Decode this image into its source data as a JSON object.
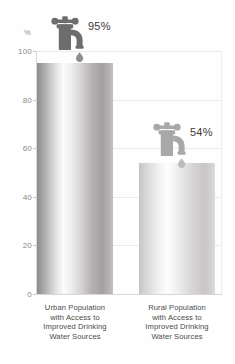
{
  "chart_data": {
    "type": "bar",
    "title": "",
    "xlabel": "",
    "ylabel": "%",
    "ylim": [
      0,
      100
    ],
    "grid": true,
    "legend": "none",
    "categories": [
      "Urban Population with Access to Improved Drinking Water Sources",
      "Rural Population with Access to Improved Drinking Water Sources"
    ],
    "values": [
      95,
      54
    ],
    "value_labels": [
      "95%",
      "54%"
    ],
    "yticks": [
      0,
      20,
      40,
      60,
      80,
      100
    ],
    "ytick_labels": [
      "0",
      "20",
      "40",
      "60",
      "80",
      "100"
    ],
    "unit_label": "%"
  },
  "axis": {
    "unit": "%",
    "ticks": [
      {
        "label": "100",
        "value": 100
      },
      {
        "label": "80",
        "value": 80
      },
      {
        "label": "60",
        "value": 60
      },
      {
        "label": "40",
        "value": 40
      },
      {
        "label": "20",
        "value": 20
      },
      {
        "label": "0",
        "value": 0
      }
    ]
  },
  "bars": [
    {
      "value": 95,
      "value_label": "95%",
      "icon": "faucet-icon",
      "icon_color": "#6e6c6c",
      "label_line1": "Urban Population",
      "label_line2": "with Access to",
      "label_line3": "Improved Drinking",
      "label_line4": "Water Sources"
    },
    {
      "value": 54,
      "value_label": "54%",
      "icon": "faucet-icon",
      "icon_color": "#a9a7a7",
      "label_line1": "Rural Population",
      "label_line2": "with Access to",
      "label_line3": "Improved Drinking",
      "label_line4": "Water Sources"
    }
  ],
  "colors": {
    "background": "#fefefe",
    "gridline": "#eceaea",
    "axis": "#d8d6d6",
    "tick_text": "#8d8b8b",
    "category_text": "#4b4a4a",
    "value_text": "#3b3a3a",
    "bar_dark": "#8d8b8b",
    "bar_light": "#c6c4c4"
  }
}
